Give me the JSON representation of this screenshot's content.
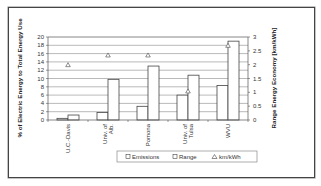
{
  "chart_data": {
    "type": "bar",
    "title": "",
    "categories": [
      "U.C.-Davis",
      "Univ. of Alb.",
      "Pomona",
      "Univ. of Tulsa",
      "WVU"
    ],
    "category_labels": [
      [
        "U.C.-Davis"
      ],
      [
        "Univ. of",
        "Alb."
      ],
      [
        "Pomona"
      ],
      [
        "Univ. of",
        "Tulsa"
      ],
      [
        "WVU"
      ]
    ],
    "series": [
      {
        "name": "Emissions",
        "type": "bar",
        "axis": "left",
        "values": [
          0.4,
          1.8,
          3.3,
          6.0,
          8.3
        ]
      },
      {
        "name": "Range",
        "type": "bar",
        "axis": "left",
        "values": [
          1.2,
          9.8,
          13.0,
          10.8,
          19.0
        ]
      },
      {
        "name": "km/kWh",
        "type": "scatter",
        "marker": "triangle",
        "axis": "right",
        "values": [
          2.0,
          2.35,
          2.35,
          1.05,
          2.7
        ]
      }
    ],
    "ylabel": "% of Electric Energy to Total Energy Use",
    "y2label": "Range Energy Economy [km/kWh]",
    "xlabel": "",
    "ylim": [
      0,
      20
    ],
    "y2lim": [
      0,
      3
    ],
    "yticks": [
      "0",
      "2",
      "4",
      "6",
      "8",
      "10",
      "12",
      "14",
      "16",
      "18",
      "20"
    ],
    "y2ticks": [
      "0",
      "0.5",
      "1",
      "1.5",
      "2",
      "2.5",
      "3"
    ],
    "grid": true,
    "legend_position": "bottom",
    "legend": [
      "Emissions",
      "Range",
      "km/kWh"
    ]
  },
  "colors": {
    "bar_fill": "#ffffff",
    "bar_stroke": "#444444",
    "grid": "#8a8a8a",
    "frame": "#444444"
  }
}
